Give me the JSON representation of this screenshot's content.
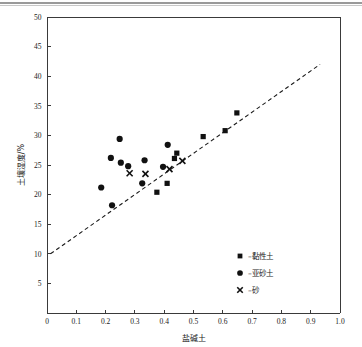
{
  "figure": {
    "background_color": "#ffffff",
    "marker_color": "#111111"
  },
  "chart_data": {
    "type": "scatter",
    "title": "",
    "xlabel": "盐碱土",
    "ylabel": "土壤湿度/%",
    "xlim": [
      0,
      1.0
    ],
    "ylim": [
      0,
      50
    ],
    "grid": false,
    "legend_position": "lower-right",
    "xticks": [
      "0",
      "0.1",
      "0.2",
      "0.3",
      "0.4",
      "0.5",
      "0.6",
      "0.7",
      "0.8",
      "0.9",
      "1.0"
    ],
    "xtick_values": [
      0,
      0.1,
      0.2,
      0.3,
      0.4,
      0.5,
      0.6,
      0.7,
      0.8,
      0.9,
      1.0
    ],
    "yticks": [
      "0",
      "5",
      "10",
      "15",
      "20",
      "25",
      "30",
      "35",
      "40",
      "45",
      "50"
    ],
    "ytick_values": [
      0,
      5,
      10,
      15,
      20,
      25,
      30,
      35,
      40,
      45,
      50
    ],
    "ytick_labels_shown": [
      "5",
      "10",
      "15",
      "20",
      "25",
      "30",
      "35",
      "40",
      "45",
      "50"
    ],
    "series": [
      {
        "name": "–黏性土",
        "marker": "square",
        "color": "#111111",
        "points": [
          {
            "x": 0.375,
            "y": 20.4
          },
          {
            "x": 0.41,
            "y": 21.9
          },
          {
            "x": 0.435,
            "y": 26.1
          },
          {
            "x": 0.443,
            "y": 27.0
          },
          {
            "x": 0.533,
            "y": 29.8
          },
          {
            "x": 0.608,
            "y": 30.8
          },
          {
            "x": 0.648,
            "y": 33.8
          }
        ]
      },
      {
        "name": "–亚砂土",
        "marker": "circle",
        "color": "#111111",
        "points": [
          {
            "x": 0.185,
            "y": 21.2
          },
          {
            "x": 0.218,
            "y": 26.2
          },
          {
            "x": 0.222,
            "y": 18.2
          },
          {
            "x": 0.248,
            "y": 29.4
          },
          {
            "x": 0.252,
            "y": 25.4
          },
          {
            "x": 0.277,
            "y": 24.8
          },
          {
            "x": 0.325,
            "y": 21.9
          },
          {
            "x": 0.333,
            "y": 25.8
          },
          {
            "x": 0.396,
            "y": 24.7
          },
          {
            "x": 0.412,
            "y": 28.4
          }
        ]
      },
      {
        "name": "–砂",
        "marker": "cross",
        "color": "#111111",
        "points": [
          {
            "x": 0.282,
            "y": 23.6
          },
          {
            "x": 0.336,
            "y": 23.5
          },
          {
            "x": 0.418,
            "y": 24.3
          },
          {
            "x": 0.462,
            "y": 25.7
          }
        ]
      }
    ],
    "trendline": {
      "style": "dashed",
      "color": "#1a1a1a",
      "x_start": 0.012,
      "y_start": 10.0,
      "x_end": 0.932,
      "y_end": 42.0
    },
    "legend": [
      {
        "marker": "square",
        "label": "–黏性土"
      },
      {
        "marker": "circle",
        "label": "–亚砂土"
      },
      {
        "marker": "cross",
        "label": "–砂"
      }
    ]
  }
}
